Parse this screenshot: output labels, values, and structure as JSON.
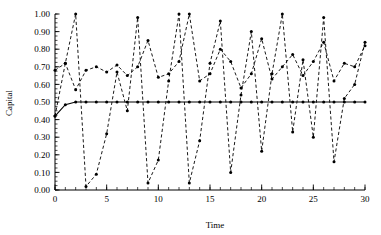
{
  "chart_data": {
    "type": "line",
    "title": "",
    "xlabel": "Time",
    "ylabel": "Capital",
    "xlim": [
      0,
      30
    ],
    "ylim": [
      0,
      1.0
    ],
    "grid": false,
    "legend": false,
    "x_ticks": [
      0,
      5,
      10,
      15,
      20,
      25,
      30
    ],
    "x_tick_labels": [
      "0",
      "5",
      "10",
      "15",
      "20",
      "25",
      "30"
    ],
    "x_minor_step": 1,
    "y_ticks": [
      0.0,
      0.1,
      0.2,
      0.3,
      0.4,
      0.5,
      0.6,
      0.7,
      0.8,
      0.9,
      1.0
    ],
    "y_tick_labels": [
      "0.00",
      "0.10",
      "0.20",
      "0.30",
      "0.40",
      "0.50",
      "0.60",
      "0.70",
      "0.80",
      "0.90",
      "1.00"
    ],
    "y_minor_step": 0.025,
    "x": [
      0,
      1,
      2,
      3,
      4,
      5,
      6,
      7,
      8,
      9,
      10,
      11,
      12,
      13,
      14,
      15,
      16,
      17,
      18,
      19,
      20,
      21,
      22,
      23,
      24,
      25,
      26,
      27,
      28,
      29,
      30
    ],
    "series": [
      {
        "name": "steady-capital",
        "style": "solid",
        "marker": "dot",
        "values": [
          0.42,
          0.485,
          0.5,
          0.5,
          0.5,
          0.5,
          0.5,
          0.5,
          0.5,
          0.5,
          0.5,
          0.5,
          0.5,
          0.5,
          0.5,
          0.5,
          0.5,
          0.5,
          0.5,
          0.5,
          0.5,
          0.5,
          0.5,
          0.5,
          0.5,
          0.5,
          0.5,
          0.5,
          0.5,
          0.5,
          0.5
        ]
      },
      {
        "name": "oscillating-capital",
        "style": "dashed",
        "marker": "dot",
        "values": [
          0.68,
          0.72,
          0.57,
          0.68,
          0.7,
          0.67,
          0.71,
          0.65,
          0.7,
          0.85,
          0.64,
          0.66,
          0.73,
          1.0,
          0.62,
          0.66,
          0.8,
          0.73,
          0.58,
          0.66,
          0.86,
          0.63,
          0.7,
          0.77,
          0.65,
          0.73,
          0.84,
          0.62,
          0.72,
          0.7,
          0.82
        ]
      },
      {
        "name": "sawtooth-capital",
        "style": "dashed",
        "marker": "dot",
        "values": [
          0.42,
          0.72,
          1.0,
          0.02,
          0.09,
          0.32,
          0.67,
          0.45,
          0.98,
          0.04,
          0.17,
          0.62,
          1.0,
          0.04,
          0.28,
          0.72,
          0.96,
          0.1,
          0.54,
          0.9,
          0.22,
          0.66,
          1.0,
          0.33,
          0.74,
          0.3,
          0.98,
          0.16,
          0.52,
          0.6,
          0.84
        ]
      }
    ]
  }
}
